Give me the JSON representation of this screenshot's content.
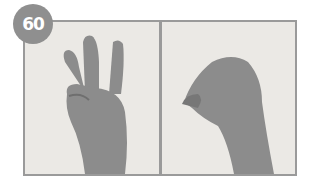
{
  "badge": {
    "number": "60"
  },
  "panels": [
    {
      "id": "left",
      "description": "hand showing three raised fingers (index, middle, ring) with thumb holding down pinky"
    },
    {
      "id": "right",
      "description": "hand with fingertips pinched together against thumb"
    }
  ],
  "colors": {
    "frame": "#9a9a9a",
    "badge": "#8f8f8f",
    "background": "#ebe9e5",
    "skin": "#8a8a8a"
  }
}
